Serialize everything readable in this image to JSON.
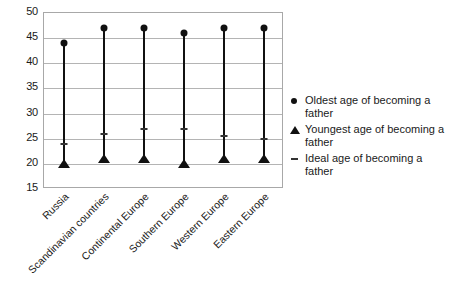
{
  "chart_data": {
    "type": "scatter",
    "title": "",
    "subtitle": "",
    "xlabel": "",
    "ylabel": "",
    "ylim": [
      15,
      50
    ],
    "yticks": [
      15,
      20,
      25,
      30,
      35,
      40,
      45,
      50
    ],
    "ytick_labels": [
      "15",
      "20",
      "25",
      "30",
      "35",
      "40",
      "45",
      "50"
    ],
    "grid": true,
    "legend_position": "right",
    "categories": [
      "Russia",
      "Scandinavian countries",
      "Continental Europe",
      "Southern Europe",
      "Western Europe",
      "Eastern Europe"
    ],
    "series": [
      {
        "name": "Oldest age of becoming a father",
        "marker": "circle",
        "color": "#111111",
        "values": [
          44,
          47,
          47,
          46,
          47,
          47
        ]
      },
      {
        "name": "Youngest age of becoming a father",
        "marker": "triangle",
        "color": "#111111",
        "values": [
          19.5,
          20.5,
          20.5,
          19.5,
          20.5,
          20.5
        ]
      },
      {
        "name": "Ideal age of becoming a father",
        "marker": "dash",
        "color": "#333333",
        "values": [
          24,
          26,
          27,
          27,
          25.5,
          25
        ]
      }
    ]
  },
  "legend": {
    "items": [
      {
        "marker": "circle-icon",
        "label": "Oldest age of becoming a father"
      },
      {
        "marker": "triangle-icon",
        "label": "Youngest age of becoming a father"
      },
      {
        "marker": "dash-icon",
        "label": "Ideal age of becoming a father"
      }
    ]
  },
  "colors": {
    "marker": "#111111",
    "gridline": "#b4b4b4",
    "axis": "#a8a8a8",
    "text": "#1a1a1a",
    "background": "#ffffff"
  }
}
